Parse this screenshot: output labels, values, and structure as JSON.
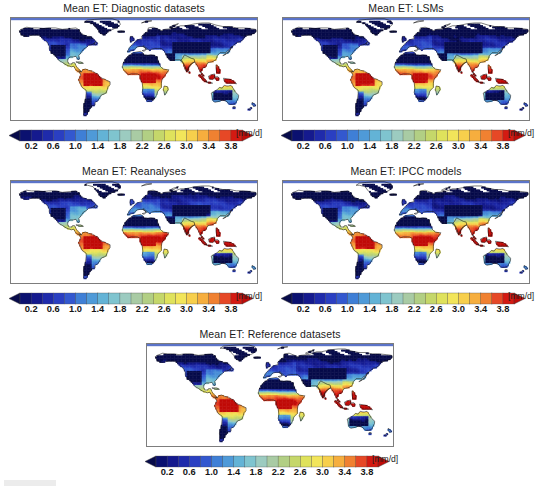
{
  "figure": {
    "width": 542,
    "height": 495,
    "background": "#ffffff",
    "caption_artifact": ""
  },
  "units_label": "[mm/d]",
  "panels": [
    {
      "id": "diagnostic",
      "title": "Mean ET: Diagnostic datasets"
    },
    {
      "id": "lsms",
      "title": "Mean ET: LSMs"
    },
    {
      "id": "reanalyses",
      "title": "Mean ET: Reanalyses"
    },
    {
      "id": "ipcc",
      "title": "Mean ET: IPCC models"
    },
    {
      "id": "reference",
      "title": "Mean ET: Reference datasets"
    }
  ],
  "chart_data": {
    "type": "heatmap",
    "subtitle": "Five product families compared on a common colour scale",
    "variable": "Mean ET",
    "units": "mm/d",
    "projection": "equirectangular",
    "xlabel": "",
    "ylabel": "",
    "grid": false,
    "legend_position": "below-each-panel",
    "xlim": [
      -180,
      180
    ],
    "ylim": [
      -60,
      84
    ],
    "colorbar": {
      "label": "[mm/d]",
      "tick_labels": [
        "0.2",
        "0.6",
        "1.0",
        "1.4",
        "1.8",
        "2.2",
        "2.6",
        "3.0",
        "3.4",
        "3.8"
      ],
      "tick_values": [
        0.2,
        0.6,
        1.0,
        1.4,
        1.8,
        2.2,
        2.6,
        3.0,
        3.4,
        3.8
      ],
      "vmin": 0.0,
      "vmax": 4.0,
      "step": 0.2,
      "extend": "both",
      "n_segments": 20,
      "colors": [
        "#0b1170",
        "#151a8e",
        "#1f2bab",
        "#2a3fc2",
        "#3358cf",
        "#3f7fd6",
        "#4f9ad8",
        "#63b3d6",
        "#7fc4cf",
        "#9ccbc0",
        "#a9cba4",
        "#b2cf84",
        "#c5d76a",
        "#dfe25c",
        "#f2e55a",
        "#f7cf4c",
        "#f6ae3e",
        "#f08131",
        "#e64826",
        "#d41a12"
      ],
      "under_color": "#070b4a",
      "over_color": "#c00b08"
    },
    "panels": [
      {
        "id": "diagnostic",
        "title": "Mean ET: Diagnostic datasets",
        "regional_means": [
          {
            "region": "Amazon basin",
            "value": 3.6
          },
          {
            "region": "Congo basin",
            "value": 3.4
          },
          {
            "region": "Maritime Continent",
            "value": 3.9
          },
          {
            "region": "Sahara",
            "value": 0.1
          },
          {
            "region": "Southern Africa",
            "value": 1.8
          },
          {
            "region": "Eastern North America",
            "value": 1.6
          },
          {
            "region": "Western North America",
            "value": 0.9
          },
          {
            "region": "Boreal Siberia",
            "value": 0.7
          },
          {
            "region": "Europe",
            "value": 1.3
          },
          {
            "region": "South Asia",
            "value": 2.4
          },
          {
            "region": "East Asia",
            "value": 2.0
          },
          {
            "region": "Australia interior",
            "value": 0.9
          },
          {
            "region": "Greenland/Arctic",
            "value": 0.1
          }
        ]
      },
      {
        "id": "lsms",
        "title": "Mean ET: LSMs",
        "regional_means": [
          {
            "region": "Amazon basin",
            "value": 3.5
          },
          {
            "region": "Congo basin",
            "value": 3.3
          },
          {
            "region": "Maritime Continent",
            "value": 3.8
          },
          {
            "region": "Sahara",
            "value": 0.1
          },
          {
            "region": "Southern Africa",
            "value": 1.9
          },
          {
            "region": "Eastern North America",
            "value": 1.7
          },
          {
            "region": "Western North America",
            "value": 1.0
          },
          {
            "region": "Boreal Siberia",
            "value": 0.8
          },
          {
            "region": "Europe",
            "value": 1.4
          },
          {
            "region": "South Asia",
            "value": 2.5
          },
          {
            "region": "East Asia",
            "value": 2.1
          },
          {
            "region": "Australia interior",
            "value": 1.0
          },
          {
            "region": "Greenland/Arctic",
            "value": 0.1
          }
        ]
      },
      {
        "id": "reanalyses",
        "title": "Mean ET: Reanalyses",
        "regional_means": [
          {
            "region": "Amazon basin",
            "value": 3.8
          },
          {
            "region": "Congo basin",
            "value": 3.6
          },
          {
            "region": "Maritime Continent",
            "value": 3.9
          },
          {
            "region": "Sahara",
            "value": 0.2
          },
          {
            "region": "Southern Africa",
            "value": 2.1
          },
          {
            "region": "Eastern North America",
            "value": 1.8
          },
          {
            "region": "Western North America",
            "value": 1.1
          },
          {
            "region": "Boreal Siberia",
            "value": 0.9
          },
          {
            "region": "Europe",
            "value": 1.5
          },
          {
            "region": "South Asia",
            "value": 2.8
          },
          {
            "region": "East Asia",
            "value": 2.3
          },
          {
            "region": "Australia interior",
            "value": 1.1
          },
          {
            "region": "Greenland/Arctic",
            "value": 0.1
          }
        ]
      },
      {
        "id": "ipcc",
        "title": "Mean ET: IPCC models",
        "regional_means": [
          {
            "region": "Amazon basin",
            "value": 3.5
          },
          {
            "region": "Congo basin",
            "value": 3.4
          },
          {
            "region": "Maritime Continent",
            "value": 3.8
          },
          {
            "region": "Sahara",
            "value": 0.2
          },
          {
            "region": "Southern Africa",
            "value": 2.0
          },
          {
            "region": "Eastern North America",
            "value": 1.7
          },
          {
            "region": "Western North America",
            "value": 1.0
          },
          {
            "region": "Boreal Siberia",
            "value": 0.8
          },
          {
            "region": "Europe",
            "value": 1.4
          },
          {
            "region": "South Asia",
            "value": 2.6
          },
          {
            "region": "East Asia",
            "value": 2.2
          },
          {
            "region": "Australia interior",
            "value": 1.0
          },
          {
            "region": "Greenland/Arctic",
            "value": 0.1
          }
        ]
      },
      {
        "id": "reference",
        "title": "Mean ET: Reference datasets",
        "regional_means": [
          {
            "region": "Amazon basin",
            "value": 3.7
          },
          {
            "region": "Congo basin",
            "value": 3.5
          },
          {
            "region": "Maritime Continent",
            "value": 3.9
          },
          {
            "region": "Sahara",
            "value": 0.1
          },
          {
            "region": "Southern Africa",
            "value": 1.9
          },
          {
            "region": "Eastern North America",
            "value": 1.7
          },
          {
            "region": "Western North America",
            "value": 1.0
          },
          {
            "region": "Boreal Siberia",
            "value": 0.8
          },
          {
            "region": "Europe",
            "value": 1.4
          },
          {
            "region": "South Asia",
            "value": 2.5
          },
          {
            "region": "East Asia",
            "value": 2.1
          },
          {
            "region": "Australia interior",
            "value": 0.9
          },
          {
            "region": "Greenland/Arctic",
            "value": 0.1
          }
        ]
      }
    ]
  }
}
